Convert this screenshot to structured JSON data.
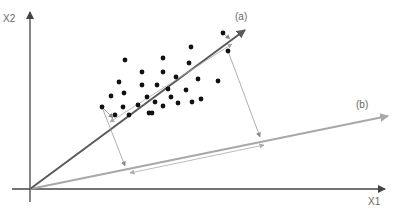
{
  "labels": {
    "x_axis": "X1",
    "y_axis": "X2",
    "axis_a": "(a)",
    "axis_b": "(b)"
  },
  "colors": {
    "axes": "#444444",
    "axis_a": "#5a5a5a",
    "axis_b": "#a8a8a8",
    "projection": "#999999",
    "points": "#111111"
  },
  "origin": [
    30,
    189
  ],
  "axis_a_end": [
    245,
    30
  ],
  "axis_b_end": [
    388,
    116
  ],
  "points": [
    [
      125,
      60
    ],
    [
      142,
      72
    ],
    [
      119,
      82
    ],
    [
      142,
      85
    ],
    [
      111,
      96
    ],
    [
      124,
      93
    ],
    [
      147,
      97
    ],
    [
      102,
      107
    ],
    [
      123,
      107
    ],
    [
      138,
      105
    ],
    [
      115,
      115
    ],
    [
      149,
      113
    ],
    [
      129,
      115
    ],
    [
      191,
      47
    ],
    [
      163,
      58
    ],
    [
      189,
      63
    ],
    [
      163,
      72
    ],
    [
      176,
      77
    ],
    [
      198,
      79
    ],
    [
      218,
      81
    ],
    [
      157,
      85
    ],
    [
      168,
      89
    ],
    [
      186,
      90
    ],
    [
      155,
      102
    ],
    [
      171,
      97
    ],
    [
      192,
      102
    ],
    [
      201,
      99
    ],
    [
      178,
      103
    ],
    [
      163,
      106
    ],
    [
      152,
      113
    ],
    [
      223,
      33
    ],
    [
      228,
      51
    ]
  ],
  "projections_b": [
    {
      "from": [
        102,
        107
      ],
      "to": [
        125,
        166
      ]
    },
    {
      "from": [
        228,
        51
      ],
      "to": [
        260,
        137
      ]
    }
  ],
  "spread_a": {
    "from": [
      110,
      122
    ],
    "to": [
      232,
      44
    ]
  },
  "spread_b": {
    "from": [
      130,
      173
    ],
    "to": [
      264,
      145
    ]
  }
}
